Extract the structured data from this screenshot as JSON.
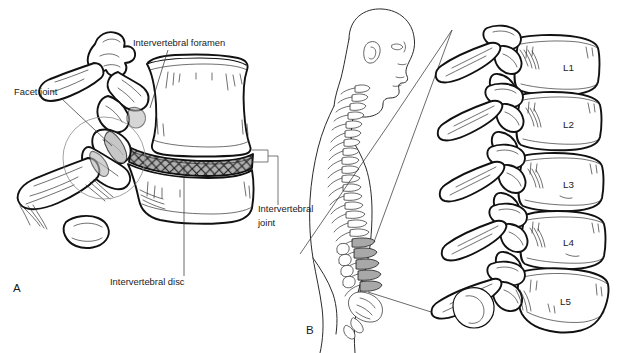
{
  "figure": {
    "background_color": "#ffffff",
    "line_color": "#111111",
    "shade_color": "#a8a8a8",
    "width": 617,
    "height": 353
  },
  "panels": [
    {
      "id": "A",
      "label": "A",
      "label_x": 13,
      "label_y": 292,
      "description": "Lateral view of two adjacent lumbar vertebrae with intervertebral disc"
    },
    {
      "id": "B",
      "label": "B",
      "label_x": 306,
      "label_y": 334,
      "description": "Lateral view of human figure showing vertebral column with lumbar region highlighted, magnified to L1-L5"
    }
  ],
  "callouts": [
    {
      "name": "intervertebral-foramen",
      "text": "Intervertebral foramen",
      "x": 133,
      "y": 46,
      "anchor": "start",
      "leader": "M 168 50 L 150 108"
    },
    {
      "name": "facet-joint",
      "text": "Facet joint",
      "x": 14,
      "y": 95,
      "anchor": "start",
      "leader": "M 62 99 L 112 146"
    },
    {
      "name": "intervertebral-joint",
      "text_line1": "Intervertebral",
      "text_line2": "joint",
      "x": 258,
      "y": 212,
      "anchor": "start",
      "leader": "M 262 205 L 262 153"
    },
    {
      "name": "intervertebral-disc",
      "text": "Intervertebral disc",
      "x": 110,
      "y": 285,
      "anchor": "start",
      "leader": "M 184 276 L 184 165"
    }
  ],
  "vertebrae": [
    {
      "name": "vertebra-l1",
      "label": "L1",
      "x": 563,
      "y": 71
    },
    {
      "name": "vertebra-l2",
      "label": "L2",
      "x": 563,
      "y": 121
    },
    {
      "name": "vertebra-l3",
      "label": "L3",
      "x": 563,
      "y": 182
    },
    {
      "name": "vertebra-l4",
      "label": "L4",
      "x": 563,
      "y": 239
    },
    {
      "name": "vertebra-l5",
      "label": "L5",
      "x": 560,
      "y": 300
    }
  ]
}
